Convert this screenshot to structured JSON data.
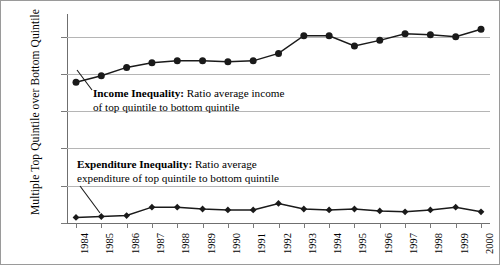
{
  "chart_data": {
    "type": "line",
    "title": "",
    "xlabel": "",
    "ylabel": "Multiple Top Quintile over Bottom Quintile",
    "ylim": [
      3.5,
      14.5
    ],
    "yticks": [
      3.5,
      5.5,
      7.5,
      9.5,
      11.5,
      13.5
    ],
    "ytick_labels": [
      "3.5",
      "5.5",
      "7.5",
      "9.5",
      "11.5",
      "13.5"
    ],
    "grid": true,
    "legend_position": "inline-annotations",
    "categories": [
      1984,
      1985,
      1986,
      1987,
      1988,
      1989,
      1990,
      1991,
      1992,
      1993,
      1994,
      1995,
      1996,
      1997,
      1998,
      1999,
      2000
    ],
    "xtick_labels": [
      "1984",
      "1985",
      "1986",
      "1987",
      "1988",
      "1989",
      "1990",
      "1991",
      "1992",
      "1993",
      "1994",
      "1995",
      "1996",
      "1997",
      "1998",
      "1999",
      "2000"
    ],
    "series": [
      {
        "name": "Income Inequality",
        "marker": "circle",
        "color": "#1a1a1a",
        "values": [
          11.05,
          11.4,
          11.85,
          12.1,
          12.2,
          12.2,
          12.15,
          12.2,
          12.6,
          13.55,
          13.55,
          13.0,
          13.3,
          13.65,
          13.6,
          13.5,
          13.9
        ]
      },
      {
        "name": "Expenditure Inequality",
        "marker": "diamond",
        "color": "#1a1a1a",
        "values": [
          3.8,
          3.85,
          3.9,
          4.35,
          4.35,
          4.25,
          4.2,
          4.2,
          4.55,
          4.25,
          4.2,
          4.25,
          4.15,
          4.1,
          4.2,
          4.35,
          4.1
        ]
      }
    ],
    "annotations": [
      {
        "id": "income-annotation",
        "bold_text": "Income Inequality:",
        "line1_rest": " Ratio average income",
        "line2": "of top quintile to bottom quintile"
      },
      {
        "id": "expenditure-annotation",
        "bold_text": "Expenditure Inequality:",
        "line1_rest": " Ratio average",
        "line2": "expenditure of top quintile to bottom quintile"
      }
    ]
  },
  "axis": {
    "y_title": "Multiple Top Quintile over Bottom Quintile"
  },
  "colors": {
    "gridline": "#b5b5b5",
    "axis": "#6f6f6f",
    "marker": "#1a1a1a",
    "line": "#1a1a1a",
    "frame": "#9a9a9a"
  }
}
